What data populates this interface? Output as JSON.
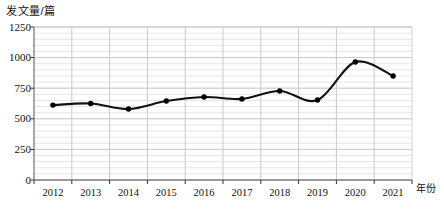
{
  "chart_data": {
    "type": "line",
    "title": "",
    "ylabel": "发文量/篇",
    "xlabel": "年份",
    "categories": [
      "2012",
      "2013",
      "2014",
      "2015",
      "2016",
      "2017",
      "2018",
      "2019",
      "2020",
      "2021"
    ],
    "values": [
      612,
      625,
      580,
      645,
      678,
      662,
      727,
      653,
      964,
      850
    ],
    "series": [
      {
        "name": "发文量",
        "values": [
          612,
          625,
          580,
          645,
          678,
          662,
          727,
          653,
          964,
          850
        ]
      }
    ],
    "ylim": [
      0,
      1250
    ],
    "yticks": [
      "0",
      "250",
      "500",
      "750",
      "1000",
      "1250"
    ],
    "ytick_values": [
      0,
      250,
      500,
      750,
      1000,
      1250
    ],
    "grid": true,
    "grid_minor_step": 50,
    "legend": "none",
    "marker": "filled-circle",
    "line_color": "#111111",
    "marker_color": "#000000",
    "grid_color": "#d9d9d9",
    "axis_color": "#555555",
    "background": "#ffffff"
  }
}
